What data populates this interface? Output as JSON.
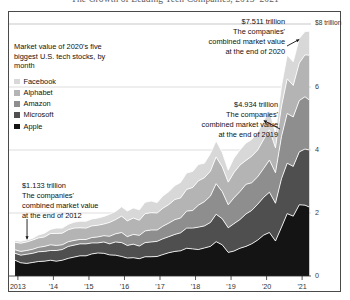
{
  "headline": "The Growth of Leading Tech Companies, 2013–2021",
  "legend": {
    "title": "Market value of 2020's five biggest U.S. tech stocks, by month",
    "items": [
      {
        "label": "Facebook",
        "color": "#d8d8d8"
      },
      {
        "label": "Alphabet",
        "color": "#b4b4b4"
      },
      {
        "label": "Amazon",
        "color": "#8e8e8e"
      },
      {
        "label": "Microsoft",
        "color": "#4f4f4f"
      },
      {
        "label": "Apple",
        "color": "#141414"
      }
    ]
  },
  "annotations": [
    {
      "id": "anno-2020",
      "value": "$7.511 trillion",
      "line1": "The companies'",
      "line2": "combined market value",
      "line3": "at the end of 2020"
    },
    {
      "id": "anno-2019",
      "value": "$4.934 trillion",
      "line1": "The companies'",
      "line2": "combined market value",
      "line3": "at the end of 2019"
    },
    {
      "id": "anno-2012",
      "value": "$1.133 trillion",
      "line1": "The companies'",
      "line2": "combined market value",
      "line3": "at the end of 2012"
    }
  ],
  "axis": {
    "y_top_label": "$8 trillion",
    "y_ticks": [
      "6",
      "4",
      "2",
      "0"
    ],
    "x_ticks": [
      "2013",
      "'14",
      "'15",
      "'16",
      "'17",
      "'18",
      "'19",
      "'20",
      "'21"
    ]
  },
  "chart_data": {
    "type": "area",
    "title": "The Growth of Leading Tech Companies, 2013–2021",
    "subtitle": "Market value of 2020's five biggest U.S. tech stocks, by month",
    "xlabel": "",
    "ylabel": "$ trillion",
    "ylim": [
      0,
      8
    ],
    "xlim": [
      2012.75,
      2021.25
    ],
    "grid": true,
    "gridlines": [
      2,
      4,
      6,
      8
    ],
    "legend_position": "upper-left",
    "stacked": true,
    "stack_order_bottom_to_top": [
      "Apple",
      "Microsoft",
      "Amazon",
      "Alphabet",
      "Facebook"
    ],
    "x": [
      2012.92,
      2013.08,
      2013.25,
      2013.42,
      2013.58,
      2013.75,
      2013.92,
      2014.08,
      2014.25,
      2014.42,
      2014.58,
      2014.75,
      2014.92,
      2015.08,
      2015.25,
      2015.42,
      2015.58,
      2015.75,
      2015.92,
      2016.08,
      2016.25,
      2016.42,
      2016.58,
      2016.75,
      2016.92,
      2017.08,
      2017.25,
      2017.42,
      2017.58,
      2017.75,
      2017.92,
      2018.08,
      2018.25,
      2018.42,
      2018.58,
      2018.75,
      2018.92,
      2019.08,
      2019.25,
      2019.42,
      2019.58,
      2019.75,
      2019.92,
      2020.08,
      2020.25,
      2020.42,
      2020.58,
      2020.75,
      2020.92,
      2021.08,
      2021.2
    ],
    "series": [
      {
        "name": "Apple",
        "color": "#141414",
        "values": [
          0.5,
          0.42,
          0.4,
          0.43,
          0.46,
          0.47,
          0.5,
          0.47,
          0.5,
          0.56,
          0.6,
          0.64,
          0.64,
          0.7,
          0.73,
          0.72,
          0.67,
          0.66,
          0.62,
          0.57,
          0.58,
          0.55,
          0.61,
          0.61,
          0.62,
          0.68,
          0.74,
          0.78,
          0.8,
          0.88,
          0.86,
          0.84,
          0.89,
          0.94,
          1.09,
          0.99,
          0.75,
          0.79,
          0.88,
          0.94,
          1.02,
          1.14,
          1.3,
          1.38,
          1.11,
          1.55,
          1.98,
          1.9,
          2.26,
          2.25,
          2.19
        ]
      },
      {
        "name": "Microsoft",
        "color": "#4f4f4f",
        "values": [
          0.22,
          0.24,
          0.29,
          0.29,
          0.31,
          0.31,
          0.31,
          0.34,
          0.34,
          0.38,
          0.38,
          0.38,
          0.38,
          0.35,
          0.32,
          0.36,
          0.35,
          0.42,
          0.44,
          0.4,
          0.43,
          0.4,
          0.45,
          0.47,
          0.48,
          0.5,
          0.51,
          0.54,
          0.57,
          0.64,
          0.66,
          0.71,
          0.7,
          0.76,
          0.87,
          0.83,
          0.78,
          0.87,
          0.91,
          1.03,
          1.06,
          1.14,
          1.2,
          1.28,
          1.2,
          1.54,
          1.6,
          1.58,
          1.68,
          1.78,
          1.81
        ]
      },
      {
        "name": "Amazon",
        "color": "#8e8e8e",
        "values": [
          0.11,
          0.12,
          0.12,
          0.13,
          0.14,
          0.16,
          0.18,
          0.16,
          0.15,
          0.15,
          0.15,
          0.14,
          0.14,
          0.17,
          0.19,
          0.2,
          0.24,
          0.26,
          0.32,
          0.28,
          0.31,
          0.34,
          0.37,
          0.38,
          0.36,
          0.4,
          0.43,
          0.47,
          0.47,
          0.54,
          0.56,
          0.7,
          0.77,
          0.84,
          0.97,
          0.86,
          0.73,
          0.82,
          0.89,
          0.94,
          0.88,
          0.87,
          0.92,
          1.02,
          0.97,
          1.34,
          1.58,
          1.57,
          1.63,
          1.66,
          1.59
        ]
      },
      {
        "name": "Alphabet",
        "color": "#b4b4b4",
        "values": [
          0.24,
          0.26,
          0.27,
          0.29,
          0.3,
          0.3,
          0.36,
          0.38,
          0.37,
          0.38,
          0.39,
          0.37,
          0.36,
          0.37,
          0.37,
          0.37,
          0.44,
          0.45,
          0.52,
          0.5,
          0.52,
          0.48,
          0.55,
          0.55,
          0.54,
          0.57,
          0.59,
          0.64,
          0.64,
          0.69,
          0.73,
          0.77,
          0.76,
          0.79,
          0.85,
          0.79,
          0.72,
          0.8,
          0.84,
          0.76,
          0.84,
          0.85,
          0.92,
          0.96,
          0.79,
          0.96,
          1.1,
          1.0,
          1.19,
          1.33,
          1.42
        ]
      },
      {
        "name": "Facebook",
        "color": "#d8d8d8",
        "values": [
          0.06,
          0.06,
          0.06,
          0.06,
          0.09,
          0.12,
          0.13,
          0.17,
          0.16,
          0.17,
          0.19,
          0.21,
          0.22,
          0.22,
          0.23,
          0.24,
          0.26,
          0.26,
          0.3,
          0.31,
          0.32,
          0.33,
          0.36,
          0.37,
          0.33,
          0.39,
          0.41,
          0.44,
          0.49,
          0.52,
          0.51,
          0.52,
          0.46,
          0.56,
          0.51,
          0.46,
          0.38,
          0.46,
          0.48,
          0.55,
          0.53,
          0.57,
          0.59,
          0.62,
          0.47,
          0.65,
          0.75,
          0.75,
          0.78,
          0.74,
          0.76
        ]
      }
    ],
    "callouts": [
      {
        "label": "$1.133 trillion combined market value at the end of 2012",
        "x": 2012.92,
        "y": 1.133
      },
      {
        "label": "$4.934 trillion combined market value at the end of 2019",
        "x": 2019.92,
        "y": 4.934
      },
      {
        "label": "$7.511 trillion combined market value at the end of 2020",
        "x": 2020.92,
        "y": 7.511
      }
    ]
  }
}
